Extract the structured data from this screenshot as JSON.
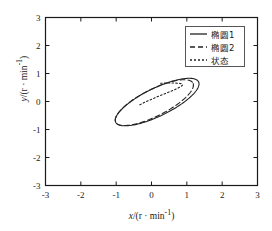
{
  "chart_data": {
    "type": "line",
    "title": "",
    "xlabel": "x/(r · min⁻¹)",
    "ylabel": "y/(r · min⁻¹)",
    "xlabel_main": "x",
    "xlabel_rest": "/(r · min",
    "xlabel_sup": "-1",
    "xlabel_tail": ")",
    "ylabel_main": "y",
    "ylabel_rest": "/(r · min",
    "ylabel_sup": "-1",
    "ylabel_tail": ")",
    "xlim": [
      -3,
      3
    ],
    "ylim": [
      -3,
      3
    ],
    "xticks": [
      -3,
      -2,
      -1,
      0,
      1,
      2,
      3
    ],
    "yticks": [
      -3,
      -2,
      -1,
      0,
      1,
      2,
      3
    ],
    "xticklabels": [
      "-3",
      "-2",
      "-1",
      "0",
      "1",
      "2",
      "3"
    ],
    "yticklabels": [
      "-3",
      "-2",
      "-1",
      "0",
      "1",
      "2",
      "3"
    ],
    "grid": false,
    "legend_position": "upper right",
    "series": [
      {
        "name": "椭圆1",
        "style": "solid",
        "color": "#222222",
        "shape": "ellipse",
        "center": [
          0.16,
          -0.02
        ],
        "semi_major": 1.38,
        "semi_minor": 0.47,
        "rotation_deg": 33
      },
      {
        "name": "椭圆2",
        "style": "dashed",
        "color": "#222222",
        "shape": "ellipse",
        "center": [
          0.08,
          -0.04
        ],
        "semi_major": 1.3,
        "semi_minor": 0.45,
        "rotation_deg": 34
      },
      {
        "name": "状态",
        "style": "dotted",
        "color": "#222222",
        "shape": "spiral_arc",
        "points": [
          [
            -0.33,
            -0.12
          ],
          [
            -0.18,
            -0.02
          ],
          [
            0.02,
            0.09
          ],
          [
            0.22,
            0.2
          ],
          [
            0.42,
            0.3
          ],
          [
            0.6,
            0.39
          ],
          [
            0.74,
            0.47
          ],
          [
            0.84,
            0.54
          ],
          [
            0.88,
            0.59
          ],
          [
            0.86,
            0.63
          ],
          [
            0.78,
            0.65
          ],
          [
            0.64,
            0.66
          ],
          [
            0.46,
            0.66
          ],
          [
            0.26,
            0.65
          ]
        ]
      }
    ]
  },
  "legend": {
    "items": [
      {
        "label": "椭圆1",
        "style": "solid"
      },
      {
        "label": "椭圆2",
        "style": "dashed"
      },
      {
        "label": "状态",
        "style": "dotted"
      }
    ]
  }
}
